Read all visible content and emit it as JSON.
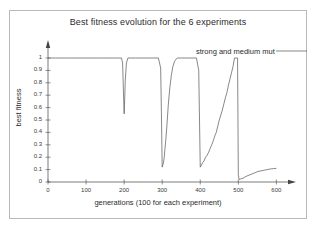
{
  "figure": {
    "background": "#ffffff",
    "border_color": "#b9b9b9",
    "line_color": "#555555",
    "axis_color": "#444444"
  },
  "annotation": {
    "text": "strong and medium mut"
  },
  "chart_data": {
    "type": "line",
    "title": "Best fitness evolution for the 6 experiments",
    "xlabel": "generations (100 for each experiment)",
    "ylabel": "best fitness",
    "xlim": [
      0,
      620
    ],
    "ylim": [
      0,
      1.05
    ],
    "grid": false,
    "legend_position": "top-right",
    "legend_entries": [
      "strong and medium mut"
    ],
    "xticks": [
      0,
      100,
      200,
      300,
      400,
      500,
      600
    ],
    "xtick_labels": [
      "0",
      "100",
      "200",
      "300",
      "400",
      "500",
      "600"
    ],
    "yticks": [
      0,
      0.1,
      0.2,
      0.3,
      0.4,
      0.5,
      0.6,
      0.7,
      0.8,
      0.9,
      1
    ],
    "ytick_labels": [
      "0",
      "0.1",
      "0.2",
      "0.3",
      "0.4",
      "0.5",
      "0.6",
      "0.7",
      "0.8",
      "0.9",
      "1"
    ],
    "series": [
      {
        "name": "best fitness",
        "x": [
          0,
          20,
          60,
          100,
          140,
          180,
          193,
          196,
          198,
          200,
          201,
          203,
          206,
          210,
          230,
          260,
          290,
          296,
          298,
          300,
          301,
          303,
          305,
          307,
          310,
          313,
          316,
          320,
          324,
          328,
          332,
          336,
          340,
          360,
          390,
          396,
          398,
          400,
          402,
          406,
          410,
          414,
          418,
          422,
          426,
          430,
          434,
          438,
          442,
          446,
          450,
          454,
          458,
          462,
          466,
          470,
          474,
          478,
          482,
          486,
          490,
          494,
          498,
          500,
          502,
          506,
          512,
          520,
          528,
          536,
          544,
          552,
          560,
          568,
          576,
          584,
          592,
          600
        ],
        "y": [
          1,
          1,
          1,
          1,
          1,
          1,
          1,
          0.96,
          0.75,
          0.55,
          0.62,
          0.82,
          0.96,
          1,
          1,
          1,
          1,
          0.92,
          0.55,
          0.12,
          0.13,
          0.15,
          0.19,
          0.26,
          0.36,
          0.48,
          0.62,
          0.76,
          0.86,
          0.93,
          0.97,
          0.99,
          1,
          1,
          1,
          0.9,
          0.5,
          0.12,
          0.13,
          0.155,
          0.17,
          0.2,
          0.215,
          0.24,
          0.27,
          0.3,
          0.33,
          0.37,
          0.4,
          0.45,
          0.5,
          0.54,
          0.58,
          0.63,
          0.68,
          0.72,
          0.78,
          0.83,
          0.88,
          0.93,
          1,
          1,
          1,
          0.06,
          0.02,
          0.025,
          0.03,
          0.045,
          0.055,
          0.065,
          0.075,
          0.085,
          0.09,
          0.095,
          0.1,
          0.105,
          0.108,
          0.11
        ]
      }
    ],
    "experiment_count": 6,
    "generations_per_experiment": 100
  }
}
